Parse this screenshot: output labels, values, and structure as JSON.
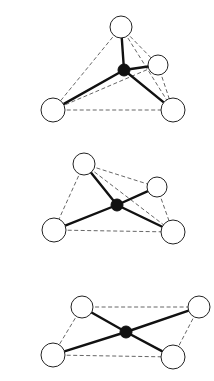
{
  "diagram": {
    "colors": {
      "background": "#ffffff",
      "ligand_fill": "#ffffff",
      "ligand_stroke": "#222222",
      "metal_fill": "#111111",
      "bond": "#111111",
      "edge": "#555555"
    },
    "figures": [
      {
        "name": "tetrahedral",
        "center": {
          "x": 124,
          "y": 70,
          "r": 6
        },
        "ligands": [
          {
            "id": "top",
            "x": 121,
            "y": 27,
            "r": 11
          },
          {
            "id": "right-back",
            "x": 158,
            "y": 65,
            "r": 10
          },
          {
            "id": "bottom-left",
            "x": 53,
            "y": 110,
            "r": 12
          },
          {
            "id": "bottom-right",
            "x": 173,
            "y": 110,
            "r": 12
          }
        ],
        "edges": [
          [
            "top",
            "bottom-left"
          ],
          [
            "top",
            "right-back"
          ],
          [
            "top",
            "bottom-right"
          ],
          [
            "bottom-left",
            "right-back"
          ],
          [
            "bottom-left",
            "bottom-right"
          ],
          [
            "right-back",
            "bottom-right"
          ]
        ]
      },
      {
        "name": "distorted",
        "center": {
          "x": 117,
          "y": 205,
          "r": 6
        },
        "ligands": [
          {
            "id": "top-left",
            "x": 84,
            "y": 164,
            "r": 11
          },
          {
            "id": "right",
            "x": 157,
            "y": 187,
            "r": 10
          },
          {
            "id": "bottom-left",
            "x": 54,
            "y": 230,
            "r": 12
          },
          {
            "id": "bottom-right",
            "x": 173,
            "y": 232,
            "r": 12
          }
        ],
        "edges": [
          [
            "top-left",
            "bottom-left"
          ],
          [
            "top-left",
            "right"
          ],
          [
            "top-left",
            "bottom-right"
          ],
          [
            "right",
            "bottom-right"
          ],
          [
            "bottom-left",
            "bottom-right"
          ]
        ]
      },
      {
        "name": "square-planar",
        "center": {
          "x": 126,
          "y": 332,
          "r": 6
        },
        "ligands": [
          {
            "id": "top-left",
            "x": 82,
            "y": 307,
            "r": 11
          },
          {
            "id": "top-right",
            "x": 199,
            "y": 307,
            "r": 11
          },
          {
            "id": "bottom-left",
            "x": 53,
            "y": 355,
            "r": 12
          },
          {
            "id": "bottom-right",
            "x": 173,
            "y": 357,
            "r": 12
          }
        ],
        "edges": [
          [
            "top-left",
            "top-right"
          ],
          [
            "top-left",
            "bottom-left"
          ],
          [
            "top-right",
            "bottom-right"
          ],
          [
            "bottom-left",
            "bottom-right"
          ]
        ]
      }
    ]
  }
}
